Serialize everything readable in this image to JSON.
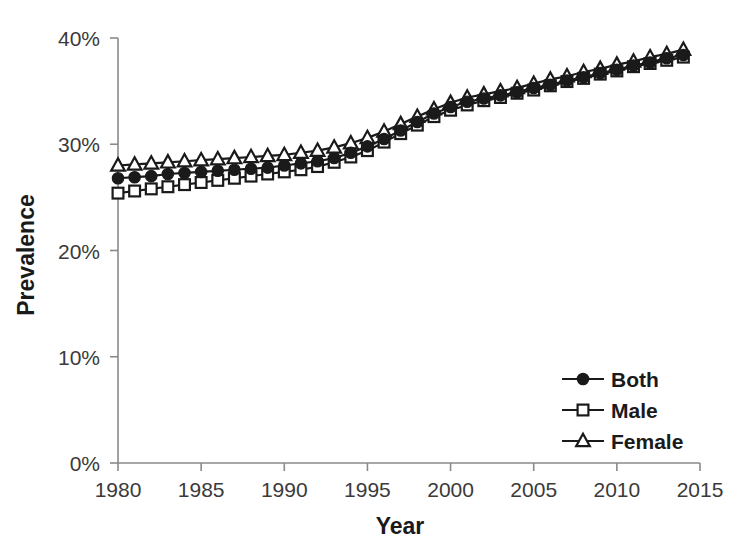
{
  "chart_data": {
    "type": "line",
    "title": "",
    "xlabel": "Year",
    "ylabel": "Prevalence",
    "xlim": [
      1980,
      2015
    ],
    "ylim": [
      0,
      40
    ],
    "grid": false,
    "legend_position": "lower-right",
    "x_tick_labels": [
      "1980",
      "1985",
      "1990",
      "1995",
      "2000",
      "2005",
      "2010",
      "2015"
    ],
    "x_ticks": [
      1980,
      1985,
      1990,
      1995,
      2000,
      2005,
      2010,
      2015
    ],
    "y_tick_labels": [
      "0%",
      "10%",
      "20%",
      "30%",
      "40%"
    ],
    "y_ticks": [
      0,
      10,
      20,
      30,
      40
    ],
    "x": [
      1980,
      1981,
      1982,
      1983,
      1984,
      1985,
      1986,
      1987,
      1988,
      1989,
      1990,
      1991,
      1992,
      1993,
      1994,
      1995,
      1996,
      1997,
      1998,
      1999,
      2000,
      2001,
      2002,
      2003,
      2004,
      2005,
      2006,
      2007,
      2008,
      2009,
      2010,
      2011,
      2012,
      2013,
      2014
    ],
    "series": [
      {
        "name": "Both",
        "marker": "filled-circle",
        "values": [
          26.8,
          26.9,
          27.0,
          27.2,
          27.3,
          27.4,
          27.5,
          27.6,
          27.7,
          27.8,
          28.0,
          28.2,
          28.4,
          28.7,
          29.2,
          29.8,
          30.5,
          31.3,
          32.1,
          32.9,
          33.5,
          34.0,
          34.3,
          34.6,
          34.9,
          35.3,
          35.6,
          36.0,
          36.3,
          36.7,
          37.0,
          37.4,
          37.7,
          38.1,
          38.4
        ]
      },
      {
        "name": "Male",
        "marker": "open-square",
        "values": [
          25.4,
          25.6,
          25.8,
          26.0,
          26.2,
          26.4,
          26.6,
          26.8,
          27.0,
          27.2,
          27.4,
          27.6,
          27.9,
          28.3,
          28.8,
          29.4,
          30.2,
          31.0,
          31.8,
          32.6,
          33.2,
          33.7,
          34.1,
          34.4,
          34.8,
          35.1,
          35.5,
          35.9,
          36.2,
          36.6,
          36.9,
          37.3,
          37.6,
          37.9,
          38.2
        ]
      },
      {
        "name": "Female",
        "marker": "open-triangle",
        "values": [
          28.0,
          28.1,
          28.2,
          28.3,
          28.4,
          28.5,
          28.6,
          28.7,
          28.8,
          28.9,
          29.0,
          29.2,
          29.4,
          29.7,
          30.1,
          30.6,
          31.2,
          31.9,
          32.6,
          33.3,
          33.9,
          34.4,
          34.7,
          35.0,
          35.3,
          35.7,
          36.1,
          36.4,
          36.8,
          37.1,
          37.5,
          37.8,
          38.2,
          38.5,
          38.9
        ]
      }
    ],
    "legend_entries": [
      {
        "label": "Both",
        "marker": "filled-circle"
      },
      {
        "label": "Male",
        "marker": "open-square"
      },
      {
        "label": "Female",
        "marker": "open-triangle"
      }
    ],
    "colors": {
      "line": "#1a1a1a",
      "marker_fill": "#1a1a1a",
      "marker_open_fill": "#ffffff",
      "axis": "#7a7a7a",
      "background": "#ffffff"
    }
  }
}
